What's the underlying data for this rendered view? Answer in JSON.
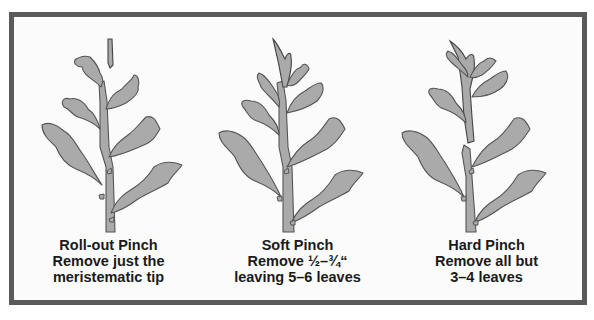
{
  "figure": {
    "colors": {
      "frame_border": "#5a5a5a",
      "background": "#fbfbfb",
      "leaf_fill": "#aaaaaa",
      "leaf_outline": "#555555",
      "caption_text": "#1a1a1a"
    },
    "panels": [
      {
        "id": "roll-out",
        "title": "Roll-out Pinch",
        "line2": "Remove just the",
        "line3": "meristematic tip",
        "illustration": "plant with only the tiny apical tip removed (tip shown detached above stem)"
      },
      {
        "id": "soft",
        "title": "Soft Pinch",
        "line2": "Remove ½–¾“",
        "line3": "leaving 5–6 leaves",
        "illustration": "plant with top shoot cluster (½–¾ inch) removed"
      },
      {
        "id": "hard",
        "title": "Hard Pinch",
        "line2": "Remove all but",
        "line3": "3–4 leaves",
        "illustration": "plant with upper portion removed leaving 3–4 leaves"
      }
    ]
  }
}
